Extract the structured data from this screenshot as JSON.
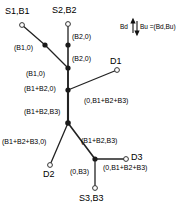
{
  "figure": {
    "type": "network-tree-diagram",
    "legend": {
      "left_text": "Bd",
      "right_text": "Bu =(Bd,Bu)",
      "arrow_icon": "up-down-arrow-icon"
    },
    "nodes": [
      {
        "id": "S1",
        "label": "S1,B1",
        "kind": "source",
        "marker": "open-circle",
        "x": 22,
        "y": 25
      },
      {
        "id": "S2",
        "label": "S2,B2",
        "kind": "source",
        "marker": "open-circle",
        "x": 68,
        "y": 24
      },
      {
        "id": "S3",
        "label": "S3,B3",
        "kind": "source",
        "marker": "open-circle",
        "x": 95,
        "y": 188
      },
      {
        "id": "D1",
        "label": "D1",
        "kind": "destination",
        "marker": "open-circle",
        "x": 117,
        "y": 70
      },
      {
        "id": "D2",
        "label": "D2",
        "kind": "destination",
        "marker": "open-circle",
        "x": 50,
        "y": 165
      },
      {
        "id": "D3",
        "label": "D3",
        "kind": "destination",
        "marker": "open-circle",
        "x": 126,
        "y": 159
      },
      {
        "id": "R1",
        "label": "",
        "kind": "relay",
        "marker": "filled-circle",
        "x": 45,
        "y": 45
      },
      {
        "id": "R2",
        "label": "",
        "kind": "relay",
        "marker": "filled-circle",
        "x": 68,
        "y": 45
      },
      {
        "id": "R3",
        "label": "",
        "kind": "relay",
        "marker": "filled-circle",
        "x": 68,
        "y": 68
      },
      {
        "id": "R4",
        "label": "",
        "kind": "relay",
        "marker": "filled-circle",
        "x": 68,
        "y": 90
      },
      {
        "id": "R5",
        "label": "",
        "kind": "relay",
        "marker": "filled-circle",
        "x": 68,
        "y": 123
      },
      {
        "id": "R6",
        "label": "",
        "kind": "relay",
        "marker": "filled-circle",
        "x": 95,
        "y": 159
      }
    ],
    "edges": [
      {
        "from": "S1",
        "to": "R1",
        "label": "(B1,0)"
      },
      {
        "from": "R1",
        "to": "R3",
        "label": "(B1,0)"
      },
      {
        "from": "S2",
        "to": "R2",
        "label": "(B2,0)"
      },
      {
        "from": "R2",
        "to": "R3",
        "label": "(B2,0)"
      },
      {
        "from": "R3",
        "to": "R4",
        "label": "(B1+B2,0)"
      },
      {
        "from": "D1",
        "to": "R4",
        "label": "(0,B1+B2+B3)"
      },
      {
        "from": "R4",
        "to": "R5",
        "label": "(B1+B2,B3)"
      },
      {
        "from": "R5",
        "to": "D2",
        "label": "(B1+B2+B3,0)"
      },
      {
        "from": "R5",
        "to": "R6",
        "label": "(B1+B2,B3)"
      },
      {
        "from": "R6",
        "to": "D3",
        "label": "(0,B1+B2+B3)"
      },
      {
        "from": "R6",
        "to": "S3",
        "label": "(0,B3)"
      }
    ],
    "node_labels": {
      "s1": "S1,B1",
      "s2": "S2,B2",
      "s3": "S3,B3",
      "d1": "D1",
      "d2": "D2",
      "d3": "D3"
    },
    "edge_labels": {
      "s1_r1": "(B1,0)",
      "r1_r3": "(B1,0)",
      "s2_r2": "(B2,0)",
      "r2_r3": "(B2,0)",
      "r3_r4": "(B1+B2,0)",
      "d1_r4": "(0,B1+B2+B3)",
      "r4_r5": "(B1+B2,B3)",
      "r5_d2": "(B1+B2+B3,0)",
      "r5_r6": "(B1+B2,B3)",
      "r6_d3": "(0,B1+B2+B3)",
      "r6_s3": "(0,B3)"
    },
    "colors": {
      "line": "#222222",
      "node_fill": "#1a1a1a",
      "node_open_fill": "#ffffff",
      "text": "#000000",
      "background": "#ffffff"
    }
  }
}
